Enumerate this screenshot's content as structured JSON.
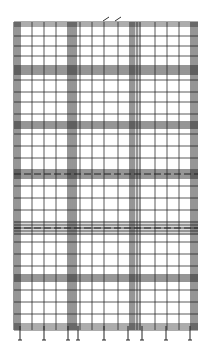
{
  "diagram": {
    "type": "grid-drawing",
    "frame": {
      "x0": 14,
      "y0": 22,
      "x1": 198,
      "y1": 330
    },
    "vertical_lines": [
      14,
      16,
      18,
      20,
      32,
      44,
      56,
      68,
      70,
      72,
      74,
      76,
      80,
      92,
      104,
      118,
      130,
      132,
      134,
      137,
      140,
      155,
      167,
      179,
      191,
      193,
      195,
      197
    ],
    "horizontal_lines": [
      22,
      24,
      26,
      36,
      46,
      56,
      66,
      68,
      70,
      72,
      74,
      80,
      92,
      102,
      114,
      122,
      124,
      126,
      128,
      134,
      146,
      158,
      170,
      172,
      174,
      176,
      178,
      186,
      198,
      210,
      222,
      225,
      228,
      231,
      234,
      242,
      254,
      266,
      275,
      277,
      279,
      281,
      290,
      302,
      314,
      324,
      326,
      328,
      330
    ],
    "bands": [
      {
        "y": 65,
        "h": 10
      },
      {
        "y": 121,
        "h": 8
      },
      {
        "y": 169,
        "h": 10
      },
      {
        "y": 221,
        "h": 14
      },
      {
        "y": 274,
        "h": 8
      }
    ],
    "vertical_bands": [
      {
        "x": 13,
        "w": 8
      },
      {
        "x": 67,
        "w": 10
      },
      {
        "x": 129,
        "w": 12
      },
      {
        "x": 190,
        "w": 8
      }
    ],
    "dashed_centerlines": [
      {
        "y": 174
      },
      {
        "y": 228
      }
    ],
    "top_markers": [
      106,
      118
    ],
    "bottom_ticks": [
      20,
      44,
      68,
      78,
      104,
      128,
      142,
      166,
      190
    ]
  }
}
